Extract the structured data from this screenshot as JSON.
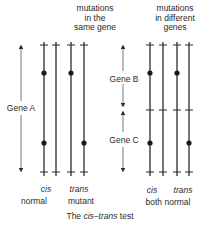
{
  "diagram": {
    "caption_prefix": "The ",
    "caption_italic": "cis–trans",
    "caption_suffix": " test",
    "left_panel": {
      "heading_lines": [
        "mutations",
        "in the",
        "same gene"
      ],
      "gene_label": "Gene A",
      "cis_label": "cis",
      "trans_label": "trans",
      "cis_result": "normal",
      "trans_result": "mutant"
    },
    "right_panel": {
      "heading_lines": [
        "mutations",
        "in different",
        "genes"
      ],
      "gene_top_label": "Gene B",
      "gene_bottom_label": "Gene C",
      "cis_label": "cis",
      "trans_label": "trans",
      "result": "both normal"
    },
    "colors": {
      "line": "#2a2a2a",
      "arrow": "#555555"
    }
  }
}
